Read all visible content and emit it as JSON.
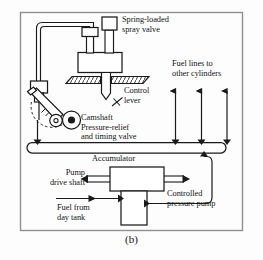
{
  "figure": {
    "caption": "(b)",
    "kind": "engineering-schematic",
    "frame_color": "#8a8a8a",
    "line_color": "#1a1a1a",
    "fill_color": "#ffffff",
    "background": "#fdfdfd"
  },
  "labels": {
    "spray_valve": "Spring-loaded\nspray valve",
    "fuel_lines": "Fuel lines to\nother cylinders",
    "control_lever": "Control\nlever",
    "camshaft_valve": "Camshaft\nPressure-relief\nand timing valve",
    "accumulator": "Accumulator",
    "pump_drive_shaft": "Pump\ndrive shaft",
    "controlled_pump": "Controlled\npressure pump",
    "fuel_from_tank": "Fuel from\nday tank"
  },
  "components": [
    {
      "name": "spring-loaded-spray-valve",
      "label": "Spring-loaded spray valve"
    },
    {
      "name": "control-lever",
      "label": "Control lever"
    },
    {
      "name": "camshaft",
      "label": "Camshaft"
    },
    {
      "name": "pressure-relief-and-timing-valve",
      "label": "Pressure-relief and timing valve"
    },
    {
      "name": "accumulator",
      "label": "Accumulator"
    },
    {
      "name": "controlled-pressure-pump",
      "label": "Controlled pressure pump"
    },
    {
      "name": "pump-drive-shaft",
      "label": "Pump drive shaft"
    },
    {
      "name": "fuel-from-day-tank",
      "label": "Fuel from day tank"
    },
    {
      "name": "fuel-lines-to-other-cylinders",
      "label": "Fuel lines to other cylinders"
    }
  ],
  "flow_arrows": {
    "fuel_line_count": 3,
    "direction": "upward",
    "pump_inlet_direction": "rightward",
    "accumulator_feed_direction": "upward-from-pump"
  }
}
